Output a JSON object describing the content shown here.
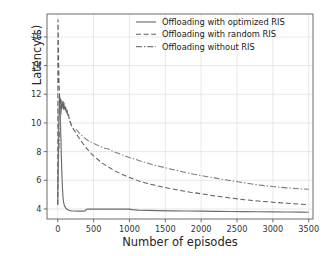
{
  "chart_data": {
    "type": "line",
    "title": "",
    "xlabel": "Number of episodes",
    "ylabel": "Latency(s)",
    "xlim": [
      -150,
      3560
    ],
    "ylim": [
      3.3,
      17.6
    ],
    "xticks": [
      0,
      500,
      1000,
      1500,
      2000,
      2500,
      3000,
      3500
    ],
    "xticklabels": [
      "0",
      "500",
      "1000",
      "1500",
      "2000",
      "2500",
      "3000",
      "3500"
    ],
    "yticks": [
      4,
      6,
      8,
      10,
      12,
      14,
      16
    ],
    "yticklabels": [
      "4",
      "6",
      "8",
      "10",
      "12",
      "14",
      "16"
    ],
    "grid": true,
    "grid_color": "#d9d9d9",
    "legend_position": "upper right",
    "legend_frame": false,
    "axes_color": "#5a5a5a",
    "series": [
      {
        "name": "Offloading with optimized RIS",
        "style": "solid",
        "color": "#6b6b6b",
        "x": [
          0,
          8,
          16,
          24,
          32,
          40,
          48,
          56,
          64,
          72,
          80,
          90,
          100,
          110,
          120,
          135,
          150,
          170,
          190,
          210,
          240,
          280,
          320,
          360,
          380,
          392,
          400,
          420,
          460,
          520,
          600,
          700,
          800,
          900,
          960,
          990,
          1000,
          1040,
          1120,
          1250,
          1400,
          1600,
          1800,
          2000,
          2200,
          2400,
          2600,
          2800,
          3000,
          3200,
          3400,
          3500
        ],
        "y": [
          4.3,
          7.2,
          10.4,
          11.9,
          11.2,
          9.6,
          8.1,
          6.7,
          5.6,
          4.9,
          4.5,
          4.28,
          4.16,
          4.08,
          4.02,
          3.96,
          3.92,
          3.89,
          3.87,
          3.86,
          3.855,
          3.852,
          3.85,
          3.85,
          3.855,
          3.93,
          3.98,
          3.985,
          3.985,
          3.985,
          3.985,
          3.985,
          3.985,
          3.985,
          3.985,
          3.985,
          3.99,
          3.95,
          3.92,
          3.9,
          3.885,
          3.87,
          3.855,
          3.845,
          3.835,
          3.825,
          3.815,
          3.805,
          3.795,
          3.785,
          3.775,
          3.77
        ]
      },
      {
        "name": "Offloading with random RIS",
        "style": "dashed",
        "color": "#5e5e5e",
        "x": [
          0,
          4,
          8,
          12,
          18,
          24,
          30,
          36,
          42,
          48,
          54,
          60,
          66,
          72,
          78,
          84,
          90,
          96,
          104,
          112,
          120,
          130,
          140,
          150,
          160,
          175,
          190,
          205,
          220,
          240,
          265,
          290,
          320,
          360,
          400,
          450,
          500,
          560,
          620,
          700,
          780,
          860,
          950,
          1050,
          1150,
          1250,
          1400,
          1550,
          1700,
          1850,
          2000,
          2200,
          2400,
          2600,
          2800,
          3000,
          3200,
          3400,
          3500
        ],
        "y": [
          4.3,
          17.2,
          16.0,
          14.2,
          12.6,
          12.2,
          11.2,
          11.8,
          11.0,
          11.6,
          10.9,
          11.5,
          11.0,
          11.45,
          10.95,
          11.4,
          11.0,
          11.3,
          10.9,
          11.1,
          10.7,
          10.9,
          10.5,
          10.6,
          10.3,
          10.1,
          9.85,
          9.7,
          9.55,
          9.4,
          9.2,
          9.0,
          8.8,
          8.5,
          8.25,
          7.95,
          7.7,
          7.45,
          7.2,
          6.95,
          6.7,
          6.5,
          6.3,
          6.1,
          5.92,
          5.78,
          5.6,
          5.44,
          5.3,
          5.17,
          5.06,
          4.9,
          4.77,
          4.65,
          4.55,
          4.47,
          4.4,
          4.33,
          4.3
        ]
      },
      {
        "name": "Offloading without RIS",
        "style": "dashdot",
        "color": "#7a7a7a",
        "x": [
          0,
          6,
          12,
          20,
          28,
          36,
          44,
          52,
          60,
          70,
          80,
          90,
          100,
          110,
          120,
          135,
          150,
          165,
          180,
          200,
          220,
          240,
          265,
          290,
          320,
          360,
          400,
          440,
          490,
          540,
          600,
          660,
          700,
          760,
          830,
          900,
          980,
          1060,
          1150,
          1250,
          1350,
          1480,
          1600,
          1750,
          1900,
          2050,
          2200,
          2400,
          2600,
          2800,
          3000,
          3200,
          3400,
          3500
        ],
        "y": [
          5.8,
          6.6,
          7.6,
          8.6,
          9.4,
          10.1,
          10.6,
          11.0,
          11.3,
          11.5,
          11.45,
          11.3,
          11.1,
          10.95,
          10.8,
          10.6,
          10.4,
          10.15,
          9.95,
          9.7,
          9.6,
          9.58,
          9.5,
          9.35,
          9.2,
          9.0,
          8.85,
          8.72,
          8.6,
          8.48,
          8.35,
          8.22,
          8.2,
          8.05,
          7.9,
          7.78,
          7.62,
          7.5,
          7.35,
          7.2,
          7.05,
          6.9,
          6.75,
          6.58,
          6.42,
          6.28,
          6.15,
          5.98,
          5.82,
          5.68,
          5.56,
          5.47,
          5.4,
          5.37
        ]
      }
    ]
  }
}
